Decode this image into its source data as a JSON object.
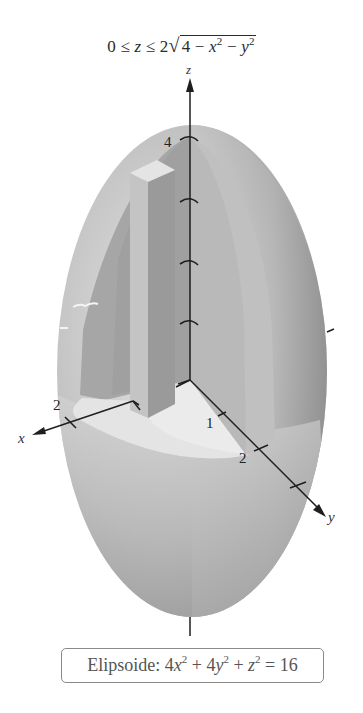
{
  "figure": {
    "title": {
      "prefix": "0 ≤ ",
      "z": "z",
      "middle": " ≤ 2",
      "radical": "√",
      "radicand_const": "4 − ",
      "x": "x",
      "x_exp": "2",
      "minus": " − ",
      "y": "y",
      "y_exp": "2"
    },
    "axes": {
      "x_label": "x",
      "y_label": "y",
      "z_label": "z",
      "z_tick_labels": [
        "4"
      ],
      "x_tick_labels": [
        "2"
      ],
      "y_tick_labels": [
        "1",
        "2"
      ]
    },
    "caption": {
      "name": "Elipsoide: ",
      "c1": "4",
      "x": "x",
      "x_exp": "2",
      "plus1": " + 4",
      "y": "y",
      "y_exp": "2",
      "plus2": " + ",
      "z": "z",
      "z_exp": "2",
      "rhs": " = 16"
    },
    "colors": {
      "ellipsoid_light": "#d9d9d9",
      "ellipsoid_mid": "#b4b4b4",
      "ellipsoid_dark": "#8e8e8e",
      "cutaway_wall": "#a9a9a9",
      "floor": "#e6e6e6",
      "column": "#9d9d9d",
      "axis": "#1e1e1e",
      "caption_border": "#8a8a8a"
    }
  }
}
